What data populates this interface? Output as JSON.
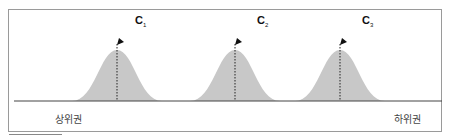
{
  "diagram": {
    "peaks": [
      {
        "id": "c1",
        "letter": "C",
        "subscript": "1",
        "center_x": 117
      },
      {
        "id": "c2",
        "letter": "C",
        "subscript": "2",
        "center_x": 235
      },
      {
        "id": "c3",
        "letter": "C",
        "subscript": "3",
        "center_x": 340
      }
    ],
    "axis_left_label": "상위권",
    "axis_right_label": "하위권",
    "colors": {
      "curve_fill": "#c8c8c8",
      "baseline": "#444444",
      "frame": "#9a9a9a",
      "marker": "#111111"
    }
  }
}
